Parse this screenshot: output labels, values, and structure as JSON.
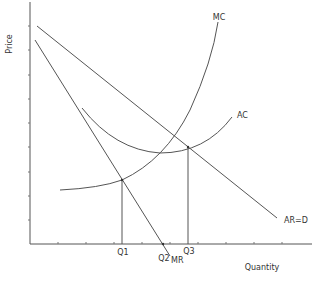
{
  "diagram": {
    "y_axis_label": "Price",
    "x_axis_label": "Quantity",
    "curves": {
      "mc": "MC",
      "ac": "AC",
      "ard": "AR=D",
      "mr": "MR"
    },
    "quantities": {
      "q1": "Q1",
      "q2": "Q2",
      "q3": "Q3"
    },
    "colors": {
      "line": "#555555",
      "text": "#333333"
    }
  }
}
